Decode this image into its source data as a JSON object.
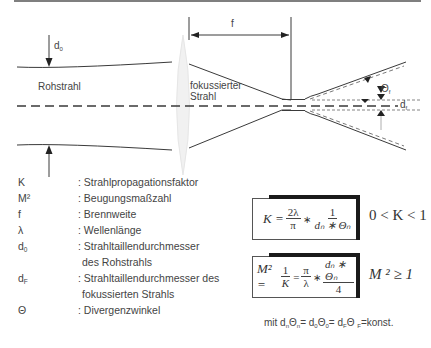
{
  "diagram": {
    "labels": {
      "raw_beam": "Rohstrahl",
      "focused_beam_line1": "fokussierter",
      "focused_beam_line2": "Strahl",
      "focal_length": "f",
      "d0_symbol": "d",
      "d0_sub": "0",
      "theta_symbol": "Θ",
      "theta_sub": "f",
      "df_symbol": "d",
      "df_sub": "f"
    },
    "colors": {
      "line": "#3a3a3a",
      "lens": "#efefef",
      "background": "#ffffff"
    }
  },
  "legend": {
    "items": [
      {
        "symbol": "K",
        "sub": "",
        "description": ": Strahlpropagationsfaktor"
      },
      {
        "symbol": "M²",
        "sub": "",
        "description": ": Beugungsmaßzahl"
      },
      {
        "symbol": "f",
        "sub": "",
        "description": ": Brennweite"
      },
      {
        "symbol": "λ",
        "sub": "",
        "description": ": Wellenlänge"
      },
      {
        "symbol": "d",
        "sub": "0",
        "description": ": Strahltaillendurchmesser"
      },
      {
        "symbol": "",
        "sub": "",
        "description": "des Rohstrahls"
      },
      {
        "symbol": "d",
        "sub": "F",
        "description": ": Strahltaillendurchmesser des"
      },
      {
        "symbol": "",
        "sub": "",
        "description": "fokussierten Strahls"
      },
      {
        "symbol": "Θ",
        "sub": "",
        "description": ": Divergenzwinkel"
      }
    ]
  },
  "formulas": {
    "k": {
      "lhs": "K =",
      "frac1_num": "2λ",
      "frac1_den": "π",
      "times": "∗",
      "frac2_num": "1",
      "frac2_den": "dₙ ∗ Θₙ",
      "condition": "0 < K < 1"
    },
    "m2": {
      "lhs": "M² =",
      "frac1_num": "1",
      "frac1_den": "K",
      "eq": "=",
      "frac2_num": "π",
      "frac2_den": "λ",
      "times": "∗",
      "frac3_num": "dₙ ∗ Θₙ",
      "frac3_den": "4",
      "condition": "M ² ≥ 1"
    },
    "note": {
      "prefix": "mit  d",
      "p1_sub": "n",
      "theta1": "Θ",
      "t1_sub": "n",
      "mid1": "= d",
      "p2_sub": "0",
      "theta2": "Θ",
      "t2_sub": "0",
      "mid2": "= d",
      "p3_sub": "F",
      "theta3": "Θ ",
      "t3_sub": "F",
      "suffix": "=konst."
    }
  }
}
